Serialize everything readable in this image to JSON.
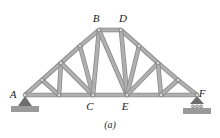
{
  "figure": {
    "caption": "(a)",
    "colors": {
      "member_fill": "#b0b0b0",
      "member_stroke": "#8a8a8a",
      "joint_fill": "#d8d8d8",
      "joint_stroke": "#6e6e6e",
      "support_fill": "#6d6d6d",
      "ground_fill": "#9a9a9a",
      "label_color": "#1a1a1a",
      "background": "#ffffff"
    }
  },
  "labels": {
    "A": "A",
    "B": "B",
    "C": "C",
    "D": "D",
    "E": "E",
    "F": "F"
  },
  "chart_data": {
    "type": "diagram",
    "subtitle": "(a)",
    "named_joints": [
      {
        "id": "A",
        "label": "A",
        "x": 25,
        "y": 95,
        "label_dx": -12,
        "label_dy": 3
      },
      {
        "id": "B",
        "label": "B",
        "x": 99,
        "y": 30,
        "label_dx": -3,
        "label_dy": -8
      },
      {
        "id": "C",
        "label": "C",
        "x": 93,
        "y": 95,
        "label_dx": -3,
        "label_dy": 15
      },
      {
        "id": "D",
        "label": "D",
        "x": 121,
        "y": 30,
        "label_dx": 2,
        "label_dy": -8
      },
      {
        "id": "E",
        "label": "E",
        "x": 127,
        "y": 95,
        "label_dx": -2,
        "label_dy": 15
      },
      {
        "id": "F",
        "label": "F",
        "x": 197,
        "y": 95,
        "label_dx": 5,
        "label_dy": 2
      }
    ],
    "unnamed_joints": [
      {
        "id": "L1",
        "x": 42,
        "y": 80
      },
      {
        "id": "L2",
        "x": 59,
        "y": 95
      },
      {
        "id": "L3",
        "x": 61,
        "y": 63
      },
      {
        "id": "L4",
        "x": 80,
        "y": 46
      },
      {
        "id": "R1",
        "x": 139,
        "y": 46
      },
      {
        "id": "R2",
        "x": 158,
        "y": 63
      },
      {
        "id": "R3",
        "x": 161,
        "y": 95
      },
      {
        "id": "R4",
        "x": 178,
        "y": 80
      }
    ],
    "members": [
      {
        "from": "A",
        "to": "L1",
        "group": "top-chord-left"
      },
      {
        "from": "L1",
        "to": "L3",
        "group": "top-chord-left"
      },
      {
        "from": "L3",
        "to": "L4",
        "group": "top-chord-left"
      },
      {
        "from": "L4",
        "to": "B",
        "group": "top-chord-left"
      },
      {
        "from": "D",
        "to": "R1",
        "group": "top-chord-right"
      },
      {
        "from": "R1",
        "to": "R2",
        "group": "top-chord-right"
      },
      {
        "from": "R2",
        "to": "R4",
        "group": "top-chord-right"
      },
      {
        "from": "R4",
        "to": "F",
        "group": "top-chord-right"
      },
      {
        "from": "B",
        "to": "D",
        "group": "ridge"
      },
      {
        "from": "A",
        "to": "L2",
        "group": "bottom-chord"
      },
      {
        "from": "L2",
        "to": "C",
        "group": "bottom-chord"
      },
      {
        "from": "C",
        "to": "E",
        "group": "bottom-chord"
      },
      {
        "from": "E",
        "to": "R3",
        "group": "bottom-chord"
      },
      {
        "from": "R3",
        "to": "F",
        "group": "bottom-chord"
      },
      {
        "from": "L1",
        "to": "L2",
        "group": "web-left"
      },
      {
        "from": "L3",
        "to": "L2",
        "group": "web-left"
      },
      {
        "from": "L3",
        "to": "C",
        "group": "web-left"
      },
      {
        "from": "L4",
        "to": "C",
        "group": "web-left"
      },
      {
        "from": "B",
        "to": "C",
        "group": "web-center-left"
      },
      {
        "from": "B",
        "to": "E",
        "group": "web-center-diagonal"
      },
      {
        "from": "D",
        "to": "E",
        "group": "web-center-right"
      },
      {
        "from": "R1",
        "to": "E",
        "group": "web-right"
      },
      {
        "from": "R2",
        "to": "E",
        "group": "web-right"
      },
      {
        "from": "R2",
        "to": "R3",
        "group": "web-right"
      },
      {
        "from": "R4",
        "to": "R3",
        "group": "web-right"
      }
    ],
    "supports": [
      {
        "at": "A",
        "kind": "pin",
        "x": 25,
        "y": 95
      },
      {
        "at": "F",
        "kind": "roller",
        "x": 197,
        "y": 95
      }
    ]
  }
}
